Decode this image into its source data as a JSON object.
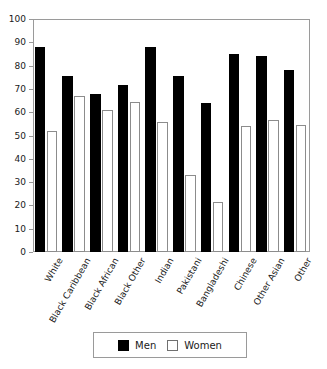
{
  "chart_data": {
    "type": "bar",
    "title": "",
    "subtitle": "",
    "xlabel": "",
    "ylabel": "",
    "ylim": [
      0,
      100
    ],
    "yticks": [
      0,
      10,
      20,
      30,
      40,
      50,
      60,
      70,
      80,
      90,
      100
    ],
    "ytick_labels": [
      "0",
      "10",
      "20",
      "30",
      "40",
      "50",
      "60",
      "70",
      "80",
      "90",
      "100"
    ],
    "grid": false,
    "legend_position": "bottom-center",
    "categories": [
      "White",
      "Black Caribbean",
      "Black African",
      "Black Other",
      "Indian",
      "Pakistani",
      "Bangladeshi",
      "Chinese",
      "Other Asian",
      "Other"
    ],
    "series": [
      {
        "name": "Men",
        "color": "#000000",
        "style": "filled",
        "values": [
          88,
          75.5,
          68,
          71.5,
          88,
          75.5,
          64,
          85,
          84,
          78
        ]
      },
      {
        "name": "Women",
        "color": "#ffffff",
        "style": "outline",
        "values": [
          52,
          67,
          61,
          64.5,
          56,
          33,
          21.5,
          54,
          56.5,
          54.5
        ]
      }
    ]
  },
  "legend": {
    "items": [
      {
        "label": "Men",
        "swatch": "filled-black-square"
      },
      {
        "label": "Women",
        "swatch": "outline-white-square"
      }
    ]
  },
  "axis": {
    "frame_color": "#9a9a9a"
  }
}
